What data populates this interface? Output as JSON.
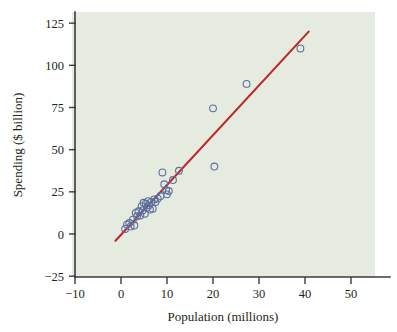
{
  "chart_data": {
    "type": "scatter",
    "title": "",
    "xlabel": "Population (millions)",
    "ylabel": "Spending ($ billion)",
    "xlim": [
      -10,
      55
    ],
    "ylim": [
      -25,
      128
    ],
    "xticks": [
      -10,
      0,
      10,
      20,
      30,
      40,
      50
    ],
    "xtick_labels": [
      "−10",
      "0",
      "10",
      "20",
      "30",
      "40",
      "50"
    ],
    "yticks": [
      -25,
      0,
      25,
      50,
      75,
      100,
      125
    ],
    "ytick_labels": [
      "−25",
      "0",
      "25",
      "50",
      "75",
      "100",
      "125"
    ],
    "grid": false,
    "legend": null,
    "marker": "open-circle",
    "marker_color": "#5b6f9e",
    "background_color": "#e6ebe0",
    "points": [
      {
        "x": 0.9,
        "y": 3.0
      },
      {
        "x": 1.3,
        "y": 5.5
      },
      {
        "x": 1.8,
        "y": 6.5
      },
      {
        "x": 2.1,
        "y": 4.5
      },
      {
        "x": 2.6,
        "y": 8.5
      },
      {
        "x": 2.9,
        "y": 5.0
      },
      {
        "x": 3.2,
        "y": 12.5
      },
      {
        "x": 3.5,
        "y": 10.5
      },
      {
        "x": 3.8,
        "y": 13.5
      },
      {
        "x": 4.2,
        "y": 11.0
      },
      {
        "x": 4.5,
        "y": 16.5
      },
      {
        "x": 4.7,
        "y": 14.0
      },
      {
        "x": 4.9,
        "y": 18.5
      },
      {
        "x": 5.2,
        "y": 12.0
      },
      {
        "x": 5.4,
        "y": 18.0
      },
      {
        "x": 5.6,
        "y": 15.5
      },
      {
        "x": 5.9,
        "y": 19.5
      },
      {
        "x": 6.1,
        "y": 17.0
      },
      {
        "x": 6.3,
        "y": 14.5
      },
      {
        "x": 6.6,
        "y": 19.0
      },
      {
        "x": 6.9,
        "y": 15.0
      },
      {
        "x": 7.2,
        "y": 20.5
      },
      {
        "x": 7.5,
        "y": 19.0
      },
      {
        "x": 8.0,
        "y": 21.0
      },
      {
        "x": 8.6,
        "y": 22.5
      },
      {
        "x": 9.0,
        "y": 36.5
      },
      {
        "x": 9.4,
        "y": 29.5
      },
      {
        "x": 9.8,
        "y": 26.0
      },
      {
        "x": 10.0,
        "y": 23.5
      },
      {
        "x": 10.4,
        "y": 25.5
      },
      {
        "x": 11.3,
        "y": 32.0
      },
      {
        "x": 12.6,
        "y": 37.5
      },
      {
        "x": 20.0,
        "y": 74.5
      },
      {
        "x": 20.3,
        "y": 40.0
      },
      {
        "x": 27.3,
        "y": 89.0
      },
      {
        "x": 39.0,
        "y": 110.0
      }
    ],
    "fit_line": {
      "color": "#c0272d",
      "x_start": -1.2,
      "y_start": -4.0,
      "x_end": 40.8,
      "y_end": 120.0
    }
  }
}
